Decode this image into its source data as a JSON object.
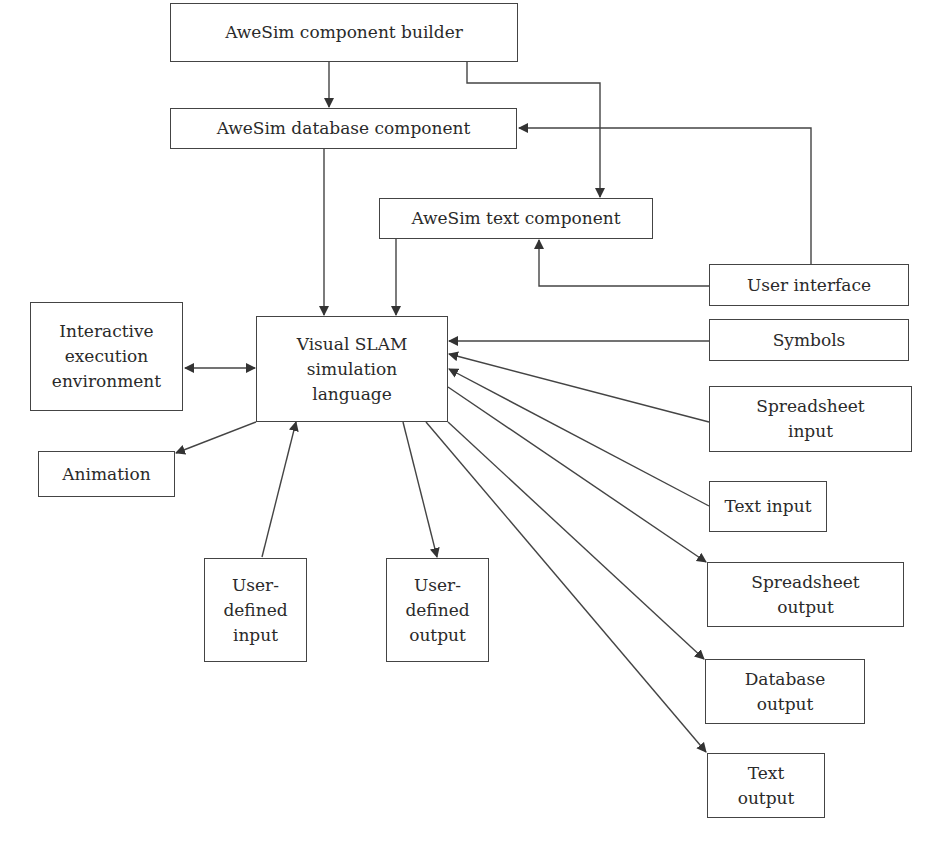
{
  "diagram": {
    "type": "block-diagram",
    "nodes": {
      "component_builder": "AweSim component builder",
      "database_component": "AweSim database component",
      "text_component": "AweSim text component",
      "user_interface": "User interface",
      "symbols": "Symbols",
      "visual_slam": "Visual SLAM\nsimulation\nlanguage",
      "interactive_env": "Interactive\nexecution\nenvironment",
      "animation": "Animation",
      "user_defined_input": "User-\ndefined\ninput",
      "user_defined_output": "User-\ndefined\noutput",
      "spreadsheet_input": "Spreadsheet\ninput",
      "text_input": "Text input",
      "spreadsheet_output": "Spreadsheet\noutput",
      "database_output": "Database\noutput",
      "text_output": "Text\noutput"
    },
    "edges": [
      {
        "from": "AweSim component builder",
        "to": "AweSim database component"
      },
      {
        "from": "AweSim component builder",
        "to": "AweSim text component"
      },
      {
        "from": "User interface",
        "to": "AweSim database component"
      },
      {
        "from": "User interface",
        "to": "AweSim text component"
      },
      {
        "from": "AweSim database component",
        "to": "Visual SLAM simulation language"
      },
      {
        "from": "AweSim text component",
        "to": "Visual SLAM simulation language"
      },
      {
        "from": "Interactive execution environment",
        "to": "Visual SLAM simulation language",
        "bidirectional": true
      },
      {
        "from": "Symbols",
        "to": "Visual SLAM simulation language"
      },
      {
        "from": "Spreadsheet input",
        "to": "Visual SLAM simulation language"
      },
      {
        "from": "Text input",
        "to": "Visual SLAM simulation language"
      },
      {
        "from": "User-defined input",
        "to": "Visual SLAM simulation language"
      },
      {
        "from": "Visual SLAM simulation language",
        "to": "Animation"
      },
      {
        "from": "Visual SLAM simulation language",
        "to": "User-defined output"
      },
      {
        "from": "Visual SLAM simulation language",
        "to": "Spreadsheet output"
      },
      {
        "from": "Visual SLAM simulation language",
        "to": "Database output"
      },
      {
        "from": "Visual SLAM simulation language",
        "to": "Text output"
      }
    ]
  }
}
